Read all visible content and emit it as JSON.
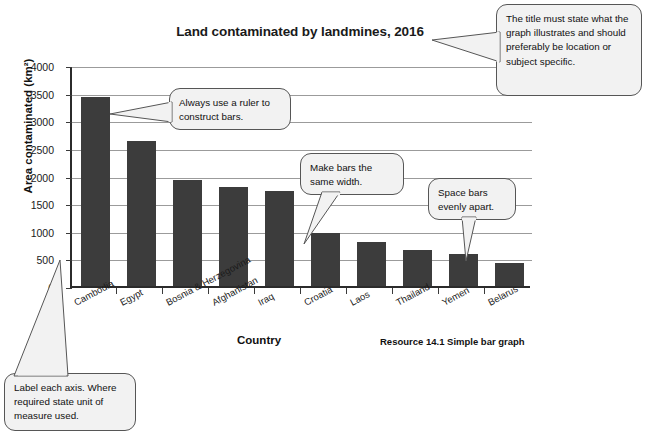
{
  "chart_data": {
    "type": "bar",
    "title": "Land contaminated by landmines, 2016",
    "xlabel": "Country",
    "ylabel": "Area contaminated (km²)",
    "categories": [
      "Cambodia",
      "Egypt",
      "Bosnia & Herzegovina",
      "Afghanistan",
      "Iraq",
      "Croatia",
      "Laos",
      "Thailand",
      "Yemen",
      "Belarus"
    ],
    "values": [
      3420,
      2620,
      1920,
      1790,
      1720,
      960,
      800,
      660,
      580,
      420
    ],
    "ylim": [
      0,
      4000
    ],
    "ytick_labels": [
      "0",
      "500",
      "1000",
      "1500",
      "2000",
      "2500",
      "3000",
      "3500",
      "4000"
    ],
    "ytick_values": [
      0,
      500,
      1000,
      1500,
      2000,
      2500,
      3000,
      3500,
      4000
    ],
    "grid": true,
    "legend": "none",
    "bar_color": "#3c3c3c",
    "gridline_color": "#9b9b9b",
    "axis_color": "#2b2b2b"
  },
  "caption": {
    "resource": "Resource 14.1 Simple bar graph"
  },
  "callouts": {
    "title_note": "The title must state what the graph illustrates and should preferably be location or subject specific.",
    "ruler_note": "Always use a ruler to construct bars.",
    "width_note": "Make bars the same width.",
    "space_note": "Space bars evenly apart.",
    "axis_label_note": "Label each axis. Where required state unit of measure used."
  }
}
